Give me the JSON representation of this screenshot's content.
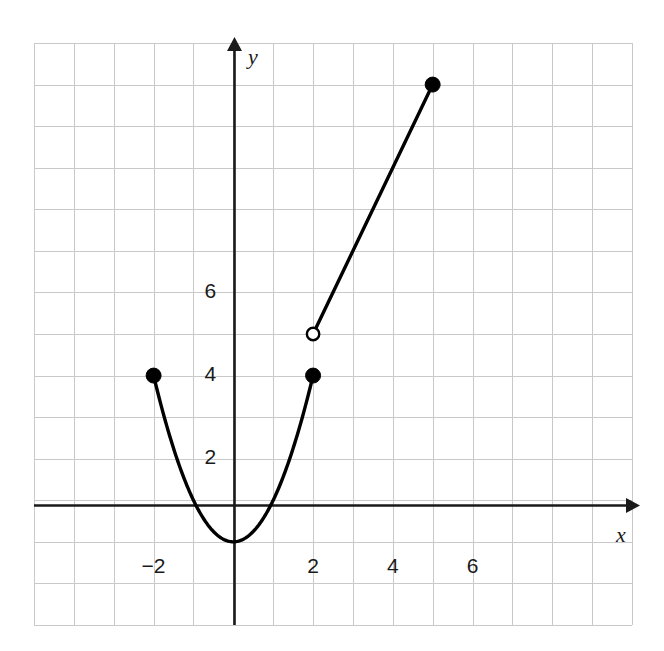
{
  "figure": {
    "width": 664,
    "height": 651,
    "background": "#ffffff"
  },
  "chart_data": {
    "type": "line",
    "title": "",
    "subtitle": "",
    "xlabel": "x",
    "ylabel": "y",
    "xlim": [
      -5,
      10
    ],
    "ylim": [
      -2,
      12
    ],
    "grid": true,
    "grid_spacing": 1,
    "legend": "none",
    "axis_color": "#1a1a1a",
    "grid_color": "#c9c9c9",
    "curve_color": "#000000",
    "xticks": [
      -2,
      2,
      4,
      6
    ],
    "xtick_labels": [
      "−2",
      "2",
      "4",
      "6"
    ],
    "yticks": [
      2,
      4,
      6
    ],
    "ytick_labels": [
      "2",
      "4",
      "6"
    ],
    "series": [
      {
        "name": "parabola-branch",
        "type": "curve",
        "equation": "y = x^2",
        "domain": [
          -2,
          2
        ],
        "points": [
          {
            "x": -2,
            "y": 4
          },
          {
            "x": -1.5,
            "y": 2.25
          },
          {
            "x": -1,
            "y": 1
          },
          {
            "x": -0.5,
            "y": 0.25
          },
          {
            "x": 0,
            "y": 0
          },
          {
            "x": 0.5,
            "y": 0.25
          },
          {
            "x": 1,
            "y": 1
          },
          {
            "x": 1.5,
            "y": 2.25
          },
          {
            "x": 2,
            "y": 4
          }
        ]
      },
      {
        "name": "linear-branch",
        "type": "segment",
        "equation": "y = 2x + 1",
        "domain": [
          2,
          5
        ],
        "points": [
          {
            "x": 2,
            "y": 5
          },
          {
            "x": 5,
            "y": 11
          }
        ]
      }
    ],
    "markers": [
      {
        "name": "closed-endpoint-left",
        "x": -2,
        "y": 4,
        "style": "filled"
      },
      {
        "name": "closed-endpoint-right",
        "x": 2,
        "y": 4,
        "style": "filled"
      },
      {
        "name": "open-endpoint",
        "x": 2,
        "y": 5,
        "style": "open"
      },
      {
        "name": "closed-endpoint-top",
        "x": 5,
        "y": 11,
        "style": "filled"
      }
    ],
    "annotations": []
  }
}
